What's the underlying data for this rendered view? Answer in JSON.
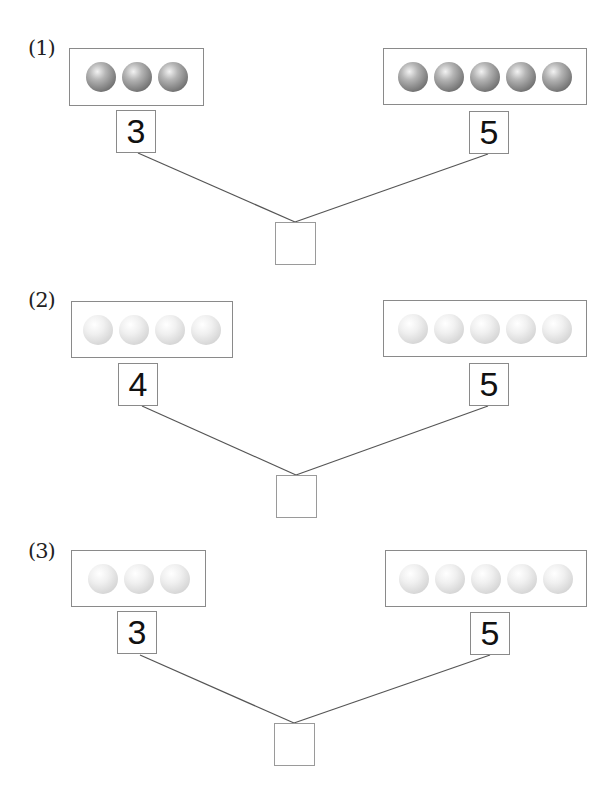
{
  "problems": [
    {
      "label": "(1)",
      "ball_style": "dark",
      "left": {
        "count": 3,
        "number": "3"
      },
      "right": {
        "count": 5,
        "number": "5"
      },
      "answer": ""
    },
    {
      "label": "(2)",
      "ball_style": "light",
      "left": {
        "count": 4,
        "number": "4"
      },
      "right": {
        "count": 5,
        "number": "5"
      },
      "answer": ""
    },
    {
      "label": "(3)",
      "ball_style": "light",
      "left": {
        "count": 3,
        "number": "3"
      },
      "right": {
        "count": 5,
        "number": "5"
      },
      "answer": ""
    }
  ],
  "colors": {
    "border": "#8a8a8a",
    "line": "#555555",
    "dark_ball": "#7a7a7a",
    "light_ball": "#d6d6d6"
  }
}
